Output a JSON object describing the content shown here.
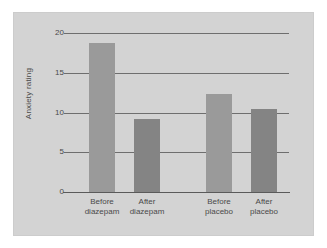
{
  "chart_data": {
    "type": "bar",
    "title": "",
    "xlabel": "",
    "ylabel": "Anxiety rating",
    "categories": [
      "Before diazepam",
      "After diazepam",
      "Before placebo",
      "After placebo"
    ],
    "category_lines": [
      {
        "line1": "Before",
        "line2": "diazepam"
      },
      {
        "line1": "After",
        "line2": "diazepam"
      },
      {
        "line1": "Before",
        "line2": "placebo"
      },
      {
        "line1": "After",
        "line2": "placebo"
      }
    ],
    "values": [
      18.7,
      9.2,
      12.3,
      10.5
    ],
    "bar_colors": [
      "#9a9a9a",
      "#848484",
      "#9a9a9a",
      "#848484"
    ],
    "ylim": [
      0,
      20
    ],
    "yticks": [
      0,
      5,
      10,
      15,
      20
    ],
    "ytick_labels": [
      "0",
      "5",
      "10",
      "15",
      "20"
    ],
    "grid": true,
    "grid_axis": "y",
    "legend": "none",
    "panel_color": "#d3d3d3",
    "axis_color": "#5a5a5a",
    "grid_color": "#6e6e6e",
    "text_color": "#4a4a4a"
  }
}
